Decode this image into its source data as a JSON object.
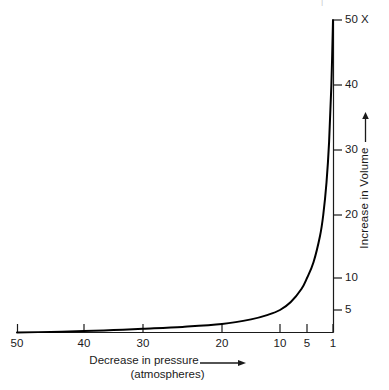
{
  "chart_data": {
    "type": "line",
    "title": "",
    "subtitle": "",
    "xlabel": "Decrease in pressure",
    "xlabel_line2": "(atmospheres)",
    "ylabel": "Increase in Volume",
    "x_axis": {
      "reversed": true,
      "scale": "nonlinear-reciprocal",
      "tick_labels": [
        "50",
        "40",
        "30",
        "20",
        "10",
        "5",
        "1"
      ],
      "tick_values": [
        50,
        40,
        30,
        20,
        10,
        5,
        1
      ],
      "tick_px": [
        17,
        84,
        143,
        222,
        280,
        307,
        333
      ],
      "range": [
        50,
        1
      ]
    },
    "y_axis": {
      "position": "right",
      "tick_labels": [
        "50 X",
        "40",
        "30",
        "20",
        "10",
        "5"
      ],
      "tick_values": [
        50,
        40,
        30,
        20,
        10,
        5
      ],
      "tick_px": [
        20,
        85,
        150,
        215,
        278,
        310
      ],
      "range": [
        1,
        50
      ],
      "unit_suffix": "X"
    },
    "grid": false,
    "legend": null,
    "series": [
      {
        "name": "Volume vs pressure (Boyle's law)",
        "color": "#000000",
        "relation": "V = 50 / P",
        "points": [
          {
            "pressure": 50,
            "volume": 1.0
          },
          {
            "pressure": 45,
            "volume": 1.11
          },
          {
            "pressure": 40,
            "volume": 1.25
          },
          {
            "pressure": 35,
            "volume": 1.43
          },
          {
            "pressure": 30,
            "volume": 1.67
          },
          {
            "pressure": 25,
            "volume": 2.0
          },
          {
            "pressure": 20,
            "volume": 2.5
          },
          {
            "pressure": 15,
            "volume": 3.33
          },
          {
            "pressure": 12,
            "volume": 4.17
          },
          {
            "pressure": 10,
            "volume": 5.0
          },
          {
            "pressure": 8,
            "volume": 6.25
          },
          {
            "pressure": 6,
            "volume": 8.33
          },
          {
            "pressure": 5,
            "volume": 10.0
          },
          {
            "pressure": 4,
            "volume": 12.5
          },
          {
            "pressure": 3,
            "volume": 16.67
          },
          {
            "pressure": 2.5,
            "volume": 20.0
          },
          {
            "pressure": 2,
            "volume": 25.0
          },
          {
            "pressure": 1.6,
            "volume": 31.25
          },
          {
            "pressure": 1.25,
            "volume": 40.0
          },
          {
            "pressure": 1,
            "volume": 50.0
          }
        ]
      }
    ]
  },
  "axes": {
    "x_ticks": [
      {
        "label": "50",
        "px": 17
      },
      {
        "label": "40",
        "px": 84
      },
      {
        "label": "30",
        "px": 143
      },
      {
        "label": "20",
        "px": 222
      },
      {
        "label": "10",
        "px": 280
      },
      {
        "label": "5",
        "px": 307
      },
      {
        "label": "1",
        "px": 333
      }
    ],
    "y_ticks": [
      {
        "label": "50 X",
        "px": 20
      },
      {
        "label": "40",
        "px": 85
      },
      {
        "label": "30",
        "px": 150
      },
      {
        "label": "20",
        "px": 215
      },
      {
        "label": "10",
        "px": 278
      },
      {
        "label": "5",
        "px": 310
      }
    ]
  },
  "labels": {
    "x_title_line1": "Decrease in pressure",
    "x_title_line2": "(atmospheres)",
    "y_title": "Increase in Volume",
    "top_artifact": "|"
  },
  "colors": {
    "curve": "#000000",
    "axis": "#1a1a1a",
    "text": "#1a1a1a",
    "background": "#ffffff"
  }
}
